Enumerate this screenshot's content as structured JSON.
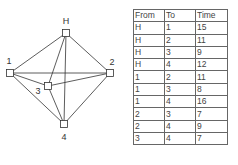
{
  "graph": {
    "nodes": [
      {
        "id": "H",
        "label": "H",
        "x": 66,
        "y": 33,
        "lx": 66,
        "ly": 24
      },
      {
        "id": "1",
        "label": "1",
        "x": 10,
        "y": 73,
        "lx": 9,
        "ly": 64
      },
      {
        "id": "2",
        "label": "2",
        "x": 110,
        "y": 73,
        "lx": 112,
        "ly": 65
      },
      {
        "id": "3",
        "label": "3",
        "x": 48,
        "y": 86,
        "lx": 38,
        "ly": 94
      },
      {
        "id": "4",
        "label": "4",
        "x": 64,
        "y": 124,
        "lx": 64,
        "ly": 140
      }
    ],
    "edges": [
      [
        "H",
        "1"
      ],
      [
        "H",
        "2"
      ],
      [
        "H",
        "3"
      ],
      [
        "H",
        "4"
      ],
      [
        "1",
        "2"
      ],
      [
        "1",
        "3"
      ],
      [
        "1",
        "4"
      ],
      [
        "2",
        "3"
      ],
      [
        "2",
        "4"
      ],
      [
        "3",
        "4"
      ]
    ]
  },
  "table": {
    "headers": {
      "from": "From",
      "to": "To",
      "time": "Time"
    },
    "rows": [
      {
        "from": "H",
        "to": "1",
        "time": "15"
      },
      {
        "from": "H",
        "to": "2",
        "time": "11"
      },
      {
        "from": "H",
        "to": "3",
        "time": "9"
      },
      {
        "from": "H",
        "to": "4",
        "time": "12"
      },
      {
        "from": "1",
        "to": "2",
        "time": "11"
      },
      {
        "from": "1",
        "to": "3",
        "time": "8"
      },
      {
        "from": "1",
        "to": "4",
        "time": "16"
      },
      {
        "from": "2",
        "to": "3",
        "time": "7"
      },
      {
        "from": "2",
        "to": "4",
        "time": "9"
      },
      {
        "from": "3",
        "to": "4",
        "time": "7"
      }
    ]
  }
}
